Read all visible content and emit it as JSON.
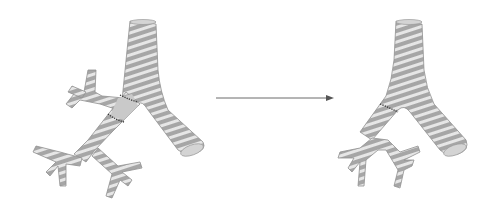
{
  "figure": {
    "panels": [
      {
        "id": "before",
        "label": ""
      },
      {
        "id": "after",
        "label": ""
      }
    ],
    "arrow": {
      "direction": "right",
      "color": "#6b6b6b"
    },
    "colors": {
      "tube": "#a9a9a9",
      "ring": "#ececec",
      "outline": "#8f8f8f",
      "suture": "#333333"
    }
  }
}
